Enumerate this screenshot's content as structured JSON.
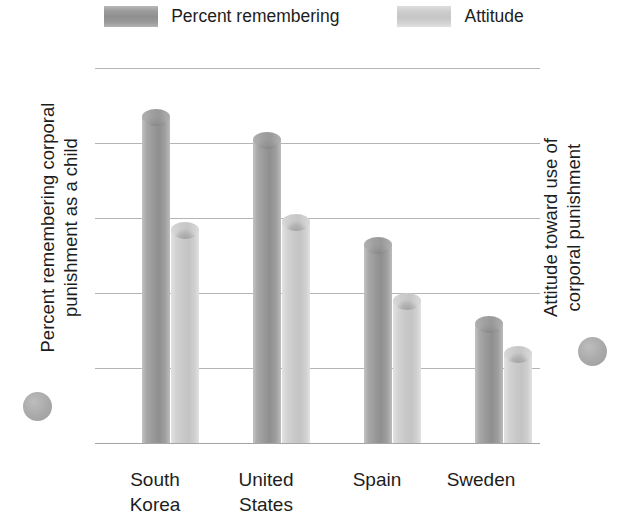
{
  "chart_data": {
    "type": "bar",
    "title": "",
    "subtitle": "",
    "categories": [
      "South Korea",
      "United States",
      "Spain",
      "Sweden"
    ],
    "series": [
      {
        "name": "Percent remembering",
        "axis": "left",
        "color": "#9a9a9a",
        "values": [
          89,
          83,
          55,
          34
        ]
      },
      {
        "name": "Attitude",
        "axis": "right",
        "color": "#c9c9c9",
        "values": [
          2.95,
          3.05,
          2.0,
          1.3
        ]
      }
    ],
    "xlabel": "",
    "ylabel": "Percent remembering corporal punishment as a child",
    "y2label": "Attitude toward use of corporal punishment",
    "ylim": [
      0,
      100
    ],
    "y2lim": [
      0,
      5
    ],
    "yticks": [
      0,
      20,
      40,
      60,
      80,
      100
    ],
    "y2ticks": [
      0,
      1,
      2,
      3,
      4,
      5
    ],
    "grid": true,
    "legend_position": "top"
  },
  "legend": {
    "items": [
      {
        "label": "Percent remembering",
        "swatch": "dark"
      },
      {
        "label": "Attitude",
        "swatch": "light"
      }
    ]
  },
  "axes": {
    "left": {
      "title_line1": "Percent remembering corporal",
      "title_line2": "punishment as a child",
      "ticks": [
        "100",
        "80",
        "60",
        "40",
        "20",
        "0"
      ]
    },
    "right": {
      "title_line1": "Attitude toward use of",
      "title_line2": "corporal punishment",
      "ticks": [
        "5",
        "4",
        "3",
        "2",
        "1",
        "0"
      ]
    }
  },
  "categories": [
    {
      "line1": "South",
      "line2": "Korea"
    },
    {
      "line1": "United",
      "line2": "States"
    },
    {
      "line1": "Spain",
      "line2": ""
    },
    {
      "line1": "Sweden",
      "line2": ""
    }
  ],
  "colors": {
    "bar_dark": "#9a9a9a",
    "bar_light": "#c9c9c9",
    "gridline": "#b5b5b5",
    "text": "#1d1d1d",
    "background": "#ffffff"
  }
}
